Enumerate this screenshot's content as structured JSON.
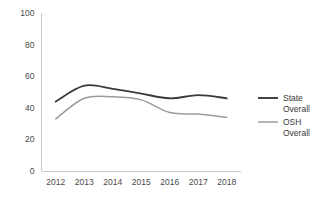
{
  "chart_data": {
    "type": "line",
    "title": "",
    "subtitle": "",
    "xlabel": "",
    "ylabel": "",
    "categories": [
      "2012",
      "2013",
      "2014",
      "2015",
      "2016",
      "2017",
      "2018"
    ],
    "x": [
      2012,
      2013,
      2014,
      2015,
      2016,
      2017,
      2018
    ],
    "series": [
      {
        "name": "State Overall",
        "legend_line1": "State",
        "legend_line2": "Overall",
        "color": "#3b3b3b",
        "width": 1.9,
        "values": [
          44,
          54,
          52,
          49,
          46,
          48,
          46
        ]
      },
      {
        "name": "OSH Overall",
        "legend_line1": "OSH",
        "legend_line2": "Overall",
        "color": "#9b9b9b",
        "width": 1.5,
        "values": [
          33,
          46,
          47,
          45,
          37,
          36,
          34
        ]
      }
    ],
    "ylim": [
      0,
      100
    ],
    "yticks": [
      0,
      20,
      40,
      60,
      80,
      100
    ],
    "ytick_labels": [
      "0",
      "20",
      "40",
      "60",
      "80",
      "100"
    ],
    "xtick_labels": [
      "2012",
      "2013",
      "2014",
      "2015",
      "2016",
      "2017",
      "2018"
    ],
    "grid": false,
    "legend_position": "right",
    "axis_color": "#c8c8c8",
    "background": "#ffffff"
  }
}
